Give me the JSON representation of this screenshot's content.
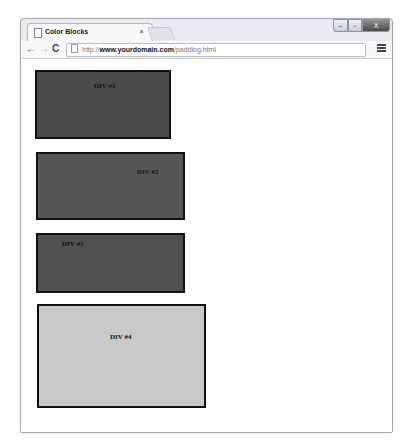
{
  "window": {
    "tab_title": "Color Blocks",
    "tab_close": "×",
    "controls": {
      "minimize": "–",
      "maximize": "▫",
      "close": "X"
    }
  },
  "toolbar": {
    "back": "←",
    "forward": "→",
    "reload": "C",
    "url_scheme": "http://",
    "url_host": "www.yourdomain.com",
    "url_path": "/padding.html"
  },
  "blocks": [
    {
      "label": "DIV #1",
      "color": "#4a4a4a"
    },
    {
      "label": "DIV #2",
      "color": "#565656"
    },
    {
      "label": "DIV #3",
      "color": "#505050"
    },
    {
      "label": "DIV #4",
      "color": "#c9c9c9"
    }
  ]
}
